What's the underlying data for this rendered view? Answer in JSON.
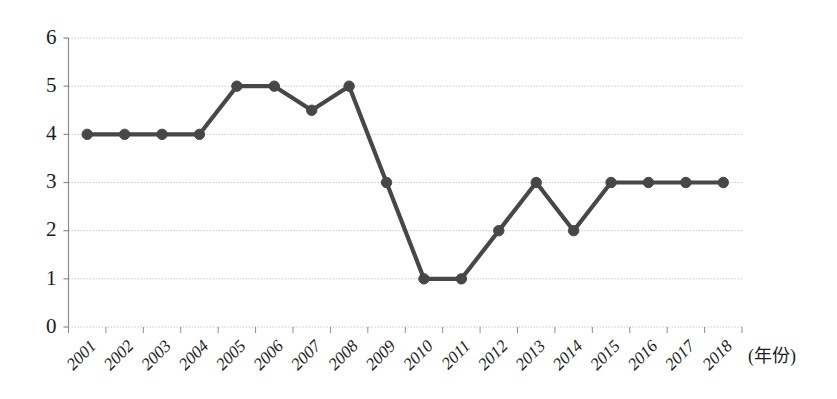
{
  "chart_data": {
    "type": "line",
    "title": "",
    "xlabel": "(年份)",
    "ylabel": "",
    "categories": [
      "2001",
      "2002",
      "2003",
      "2004",
      "2005",
      "2006",
      "2007",
      "2008",
      "2009",
      "2010",
      "2011",
      "2012",
      "2013",
      "2014",
      "2015",
      "2016",
      "2017",
      "2018"
    ],
    "values": [
      4,
      4,
      4,
      4,
      5,
      5,
      4.5,
      5,
      3,
      1,
      1,
      2,
      3,
      2,
      3,
      3,
      3,
      3
    ],
    "series": [
      {
        "name": "series-1",
        "values": [
          4,
          4,
          4,
          4,
          5,
          5,
          4.5,
          5,
          3,
          1,
          1,
          2,
          3,
          2,
          3,
          3,
          3,
          3
        ]
      }
    ],
    "ylim": [
      0,
      6
    ],
    "yticks": [
      0,
      1,
      2,
      3,
      4,
      5,
      6
    ],
    "ytick_labels": [
      "0",
      "1",
      "2",
      "3",
      "4",
      "5",
      "6"
    ],
    "grid": true,
    "grid_style": "dotted",
    "legend": "none",
    "marker": "circle",
    "colors": {
      "line": "#474747",
      "marker": "#474747",
      "grid": "#c9c9c9",
      "axis": "#8c8c8c",
      "text": "#1c1c1c",
      "background": "#ffffff"
    }
  }
}
